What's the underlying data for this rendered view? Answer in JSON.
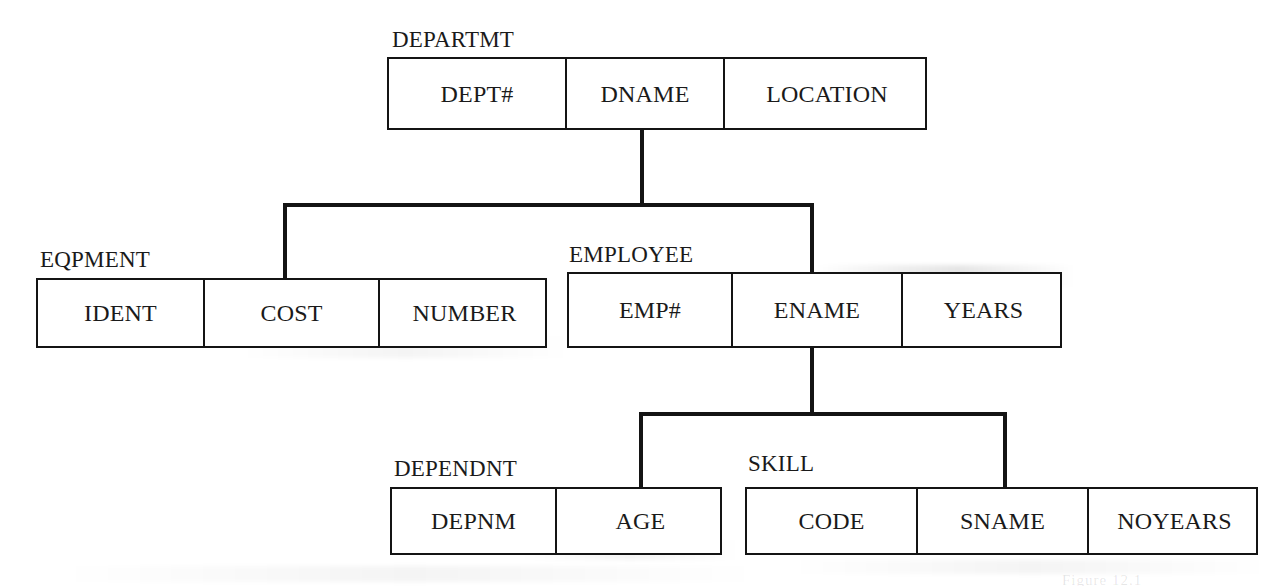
{
  "figure": {
    "type": "hierarchical-schema-diagram",
    "title": "",
    "background_color": "#ffffff",
    "line_color": "#141414",
    "text_color": "#1a1a1a",
    "caption_fragment": "Figure 12.1"
  },
  "entities": [
    {
      "id": "departmt",
      "label": "DEPARTMT",
      "fields": [
        "DEPT#",
        "DNAME",
        "LOCATION"
      ],
      "box": {
        "x": 387,
        "y": 57,
        "w": 540,
        "h": 73
      },
      "label_pos": {
        "x": 392,
        "y": 28
      },
      "col_widths": [
        178,
        158,
        204
      ]
    },
    {
      "id": "eqpment",
      "label": "EQPMENT",
      "fields": [
        "IDENT",
        "COST",
        "NUMBER"
      ],
      "box": {
        "x": 36,
        "y": 278,
        "w": 511,
        "h": 70
      },
      "label_pos": {
        "x": 40,
        "y": 248
      },
      "col_widths": [
        167,
        175,
        169
      ]
    },
    {
      "id": "employee",
      "label": "EMPLOYEE",
      "fields": [
        "EMP#",
        "ENAME",
        "YEARS"
      ],
      "box": {
        "x": 567,
        "y": 272,
        "w": 495,
        "h": 76
      },
      "label_pos": {
        "x": 569,
        "y": 243
      },
      "col_widths": [
        164,
        170,
        161
      ]
    },
    {
      "id": "dependnt",
      "label": "DEPENDNT",
      "fields": [
        "DEPNM",
        "AGE"
      ],
      "box": {
        "x": 390,
        "y": 487,
        "w": 332,
        "h": 68
      },
      "label_pos": {
        "x": 394,
        "y": 457
      },
      "col_widths": [
        165,
        167
      ]
    },
    {
      "id": "skill",
      "label": "SKILL",
      "fields": [
        "CODE",
        "SNAME",
        "NOYEARS"
      ],
      "box": {
        "x": 745,
        "y": 487,
        "w": 513,
        "h": 68
      },
      "label_pos": {
        "x": 748,
        "y": 452
      },
      "col_widths": [
        171,
        171,
        171
      ]
    }
  ],
  "connectors": [
    {
      "id": "departmt-stem",
      "orientation": "v",
      "x": 640,
      "y": 128,
      "length": 79
    },
    {
      "id": "departmt-children-bar",
      "orientation": "h",
      "x": 283,
      "y": 203,
      "length": 531
    },
    {
      "id": "eqpment-drop",
      "orientation": "v",
      "x": 283,
      "y": 203,
      "length": 77
    },
    {
      "id": "employee-drop",
      "orientation": "v",
      "x": 810,
      "y": 203,
      "length": 71
    },
    {
      "id": "employee-stem",
      "orientation": "v",
      "x": 810,
      "y": 346,
      "length": 70
    },
    {
      "id": "employee-children-bar",
      "orientation": "h",
      "x": 639,
      "y": 412,
      "length": 368
    },
    {
      "id": "dependnt-drop",
      "orientation": "v",
      "x": 639,
      "y": 412,
      "length": 77
    },
    {
      "id": "skill-drop",
      "orientation": "v",
      "x": 1003,
      "y": 412,
      "length": 77
    }
  ],
  "relationships": [
    {
      "parent": "departmt",
      "child": "eqpment"
    },
    {
      "parent": "departmt",
      "child": "employee"
    },
    {
      "parent": "employee",
      "child": "dependnt"
    },
    {
      "parent": "employee",
      "child": "skill"
    }
  ]
}
